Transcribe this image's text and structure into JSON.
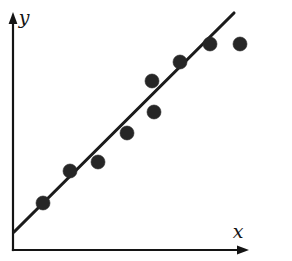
{
  "figure": {
    "background_color": "#ffffff",
    "width": 292,
    "height": 261
  },
  "axes": {
    "x_label": "x",
    "y_label": "y",
    "axis_color": "#141414",
    "origin_px": {
      "x": 13,
      "y": 250
    },
    "x_axis_end_px": {
      "x": 248,
      "y": 250
    },
    "y_axis_end_px": {
      "x": 13,
      "y": 14
    },
    "x_label_pos_px": {
      "x": 238,
      "y": 233
    },
    "y_label_pos_px": {
      "x": 24,
      "y": 19
    },
    "ticks_shown": false,
    "tick_labels": []
  },
  "chart_data": {
    "type": "scatter",
    "title": "",
    "subtitle": "",
    "xlabel": "x",
    "ylabel": "y",
    "xlim": [
      0,
      10
    ],
    "ylim": [
      0,
      10
    ],
    "grid": false,
    "legend": null,
    "axis_ticks": false,
    "point_color": "#262626",
    "point_radius_px": 7,
    "line_color": "#1b1b1b",
    "line_width_px": 3,
    "x": [
      1.3,
      2.45,
      3.65,
      4.85,
      6.0,
      5.93,
      7.13,
      8.39,
      9.66
    ],
    "y": [
      2.0,
      3.35,
      3.73,
      4.96,
      5.85,
      7.18,
      7.99,
      8.76,
      8.76
    ],
    "points_px": [
      {
        "cx": 43,
        "cy": 203
      },
      {
        "cx": 70,
        "cy": 171
      },
      {
        "cx": 98,
        "cy": 162
      },
      {
        "cx": 127,
        "cy": 133
      },
      {
        "cx": 154,
        "cy": 112
      },
      {
        "cx": 152,
        "cy": 81
      },
      {
        "cx": 180,
        "cy": 62
      },
      {
        "cx": 210,
        "cy": 44
      },
      {
        "cx": 240,
        "cy": 44
      }
    ],
    "fit_line": {
      "label": "least-squares regression line",
      "start_px": {
        "x": 14,
        "y": 232
      },
      "end_px": {
        "x": 234,
        "y": 13
      },
      "start_data": [
        0.05,
        0.78
      ],
      "end_data": [
        9.4,
        10.0
      ]
    },
    "annotations": []
  }
}
